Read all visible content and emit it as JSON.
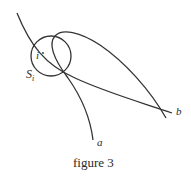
{
  "figure": {
    "caption": "figure 3",
    "labels": {
      "a": "a",
      "b": "b",
      "i": "i",
      "s": "S",
      "s_sub": "i"
    },
    "stroke_color": "#333333"
  }
}
